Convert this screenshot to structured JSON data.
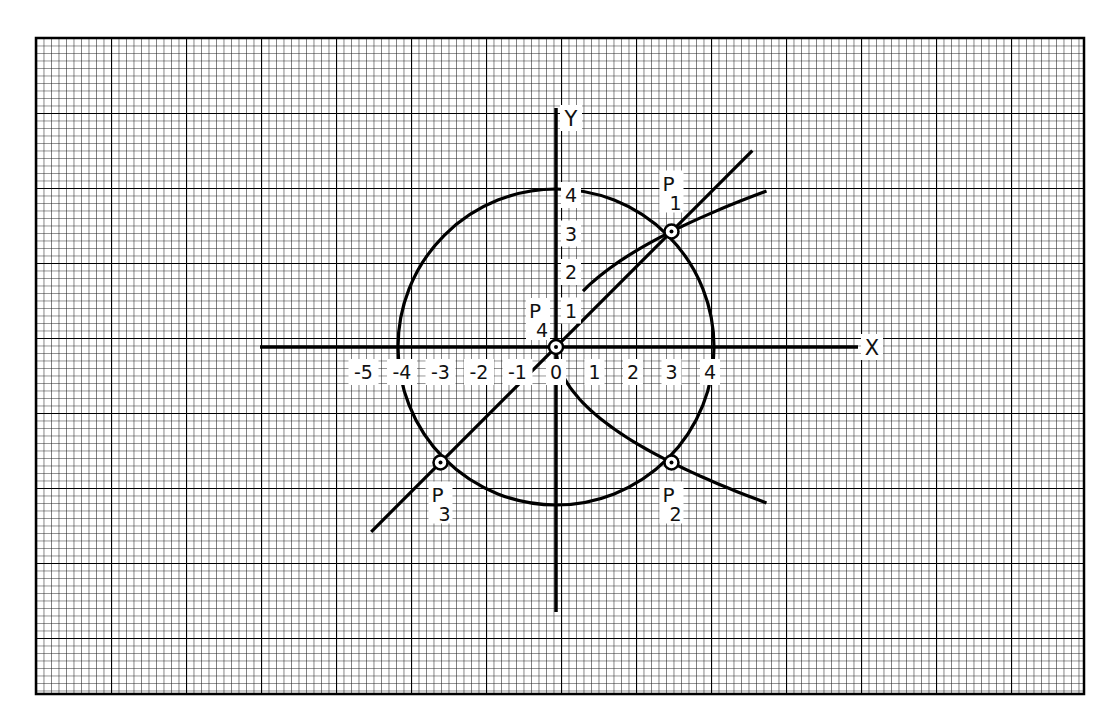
{
  "diagram": {
    "title": "",
    "axes": {
      "x_label": "X",
      "y_label": "Y",
      "x_ticks": [
        "-5",
        "-4",
        "-3",
        "-2",
        "-1",
        "0",
        "1",
        "2",
        "3",
        "4"
      ],
      "y_ticks": [
        "1",
        "2",
        "3",
        "4"
      ]
    },
    "curves": [
      {
        "name": "circle",
        "equation": "x^2 + y^2 = 16",
        "center": [
          0,
          0
        ],
        "radius": 4
      },
      {
        "name": "line",
        "equation": "y = x",
        "x_range": [
          -4.8,
          5.1
        ]
      },
      {
        "name": "parabola",
        "equation": "y^2 = 3x",
        "y_range": [
          -4,
          4
        ]
      }
    ],
    "points": [
      {
        "label": "P",
        "sub": "1",
        "x": 3,
        "y": 3
      },
      {
        "label": "P",
        "sub": "2",
        "x": 3,
        "y": -3
      },
      {
        "label": "P",
        "sub": "3",
        "x": -3,
        "y": -3
      },
      {
        "label": "P",
        "sub": "4",
        "x": 0,
        "y": 0
      }
    ]
  },
  "colors": {
    "ink": "#111111",
    "paper": "#ffffff"
  }
}
